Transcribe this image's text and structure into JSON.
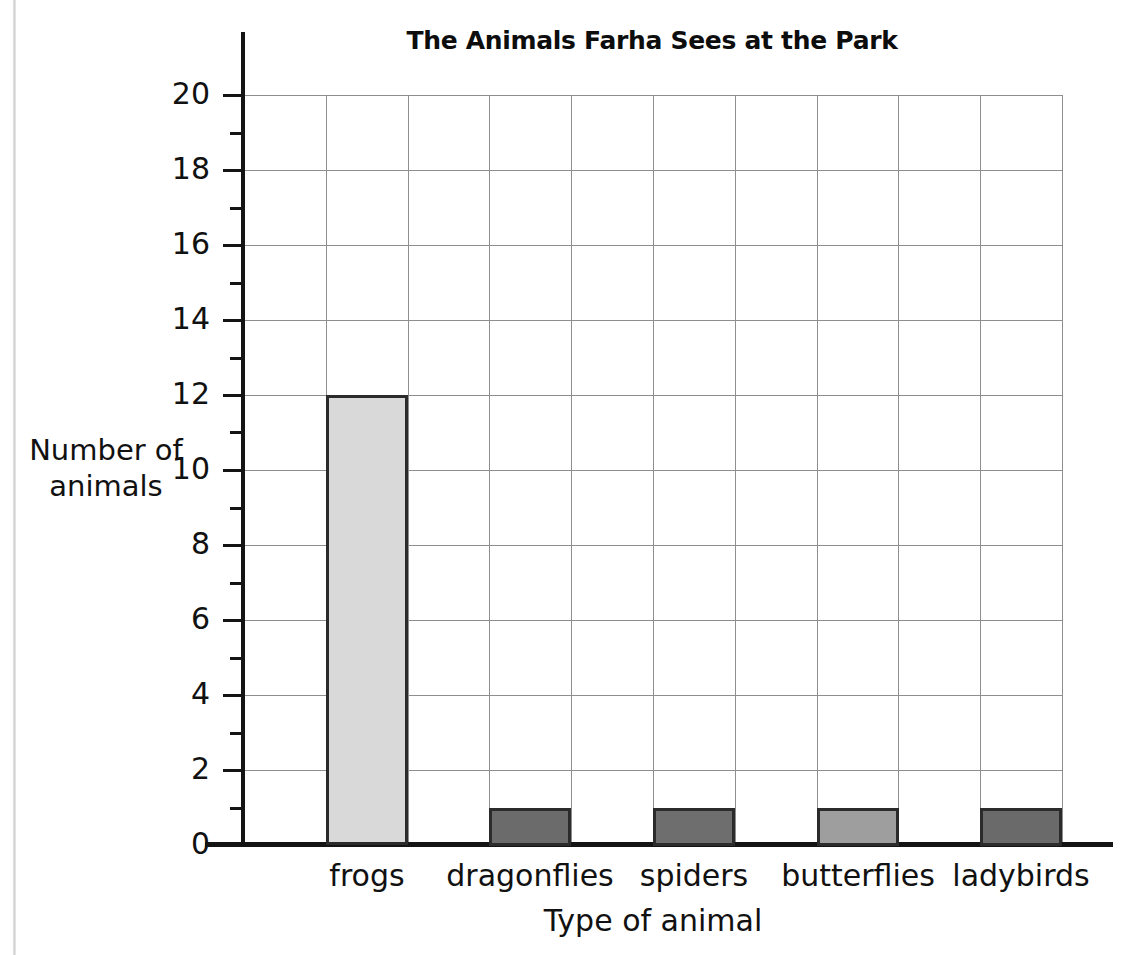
{
  "chart_data": {
    "type": "bar",
    "title": "The Animals Farha Sees at the Park",
    "xlabel": "Type of animal",
    "ylabel": "Number of\nanimals",
    "ylabel_line1": "Number of",
    "ylabel_line2": "animals",
    "categories": [
      "frogs",
      "dragonflies",
      "spiders",
      "butterflies",
      "ladybirds"
    ],
    "values": [
      12,
      1,
      1,
      1,
      1
    ],
    "bar_colors": [
      "#d9d9d9",
      "#6b6b6b",
      "#6e6e6e",
      "#9e9e9e",
      "#6a6a6a"
    ],
    "bar_border_color": "#2b2b2b",
    "ylim": [
      0,
      20
    ],
    "y_major_step": 2,
    "y_minor_step": 1,
    "y_tick_labels": [
      "0",
      "2",
      "4",
      "6",
      "8",
      "10",
      "12",
      "14",
      "16",
      "18",
      "20"
    ],
    "y_minor_ticks": [
      1,
      3,
      5,
      7,
      9,
      11,
      13,
      15,
      17,
      19
    ],
    "grid": true,
    "grid_color": "#8e8e8e",
    "grid_columns": 10,
    "legend": null,
    "axis_color": "#141414",
    "background": "#ffffff"
  }
}
